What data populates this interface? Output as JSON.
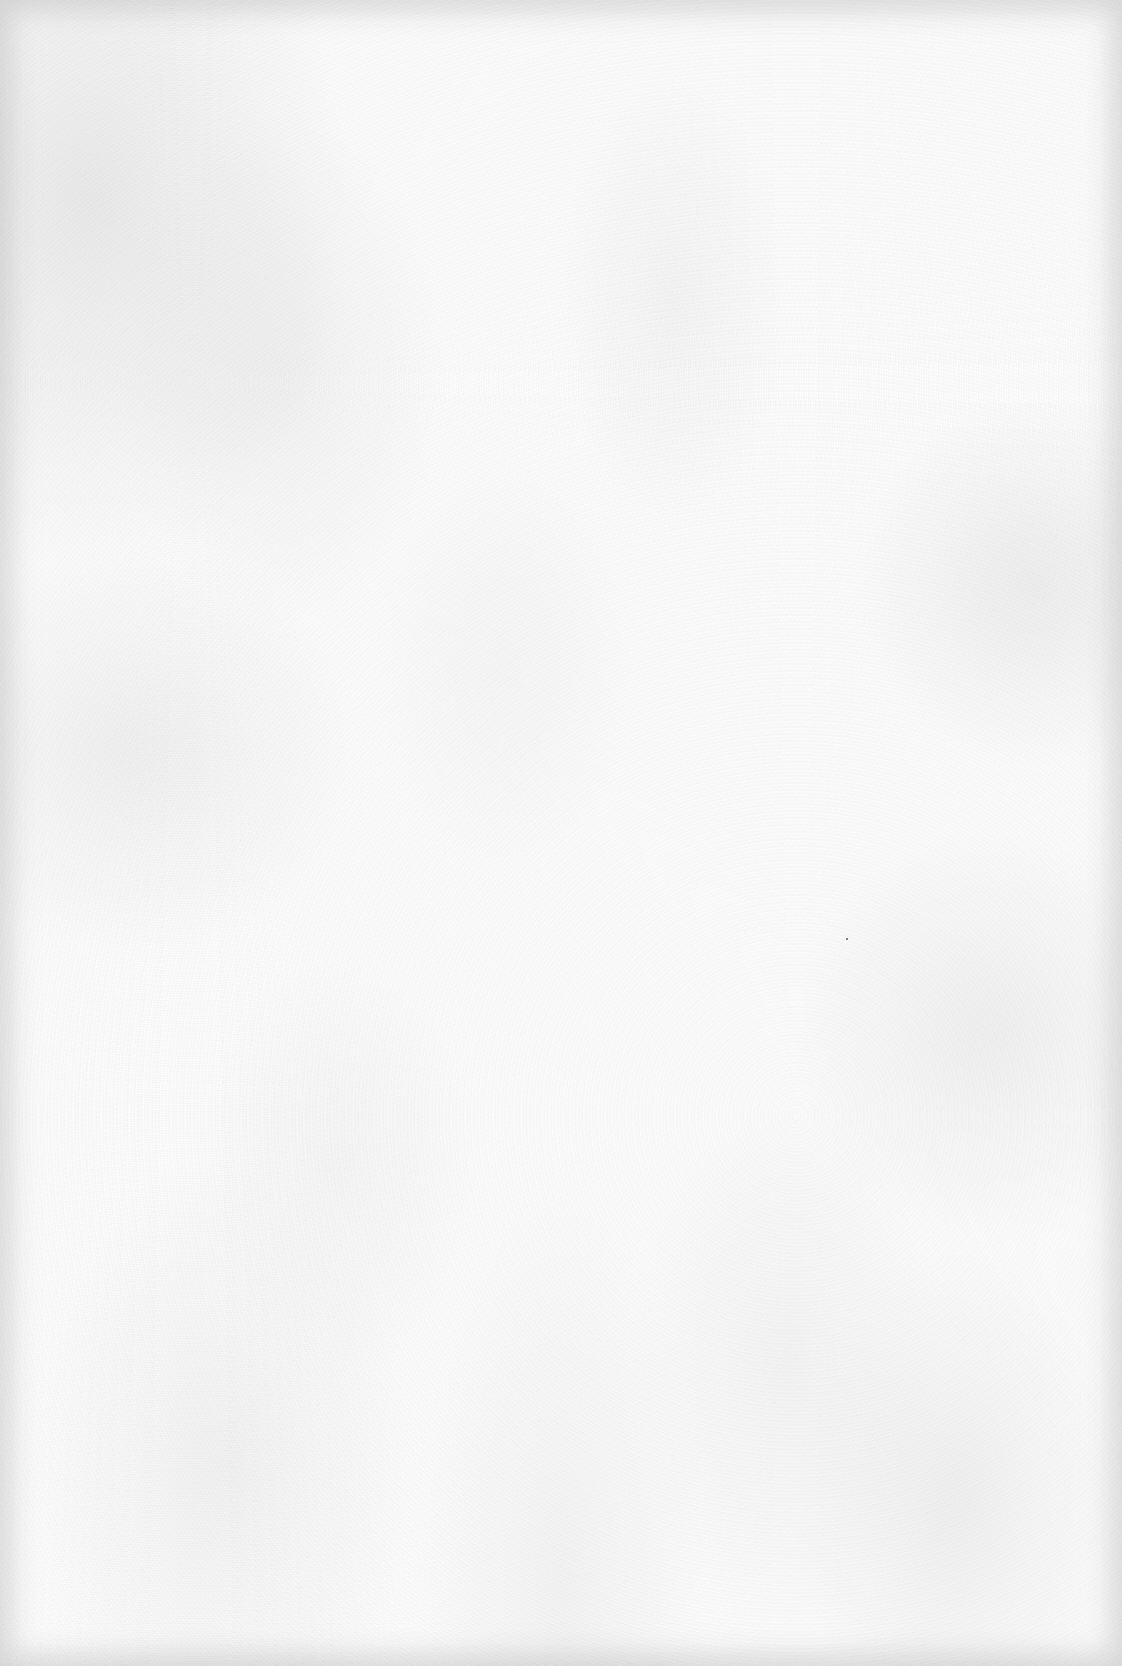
{
  "page": {
    "type": "blank-paper",
    "background_color": "#fdfdfd",
    "edge_shade_color": "#bebebe",
    "texture": "mottled gray paper noise, darker vignette at edges",
    "content": [],
    "specks": [
      {
        "x": 846,
        "y": 938,
        "color": "#555555"
      }
    ]
  }
}
